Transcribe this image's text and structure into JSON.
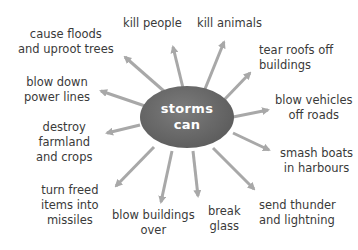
{
  "diagram": {
    "type": "mind-map",
    "center": {
      "line1": "storms",
      "line2": "can"
    },
    "colors": {
      "hub": "#666666",
      "arrow": "#a8a8a8",
      "text": "#3a3a3a",
      "background": "#ffffff"
    },
    "branches": [
      {
        "line1": "cause floods",
        "line2": "and uproot trees"
      },
      {
        "line1": "kill people",
        "line2": ""
      },
      {
        "line1": "kill animals",
        "line2": ""
      },
      {
        "line1": "tear roofs off",
        "line2": "buildings"
      },
      {
        "line1": "blow down",
        "line2": "power lines"
      },
      {
        "line1": "blow vehicles",
        "line2": "off roads"
      },
      {
        "line1": "destroy",
        "line2": "farmland",
        "line3": "and crops"
      },
      {
        "line1": "smash boats",
        "line2": "in harbours"
      },
      {
        "line1": "turn freed",
        "line2": "items into",
        "line3": "missiles"
      },
      {
        "line1": "blow buildings",
        "line2": "over"
      },
      {
        "line1": "break",
        "line2": "glass"
      },
      {
        "line1": "send thunder",
        "line2": "and lightning"
      }
    ]
  }
}
